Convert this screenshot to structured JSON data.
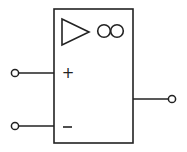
{
  "diagram": {
    "type": "operational-amplifier-symbol",
    "style": "IEC rectangular",
    "stroke_color": "#222222",
    "background": "#ffffff",
    "amplifier_symbol": "triangle",
    "gain_label": "∞",
    "inputs": [
      {
        "name": "non-inverting",
        "label": "+"
      },
      {
        "name": "inverting",
        "label": "−"
      }
    ],
    "output": {
      "name": "output"
    }
  }
}
